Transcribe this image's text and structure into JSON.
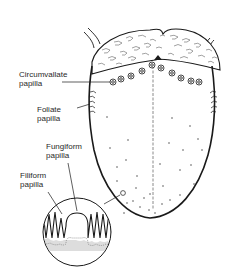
{
  "diagram": {
    "labels": [
      {
        "id": "circumvallate",
        "line1": "Circumvallate",
        "line2": "papilla"
      },
      {
        "id": "foliate",
        "line1": "Foliate",
        "line2": "papilla"
      },
      {
        "id": "fungiform",
        "line1": "Fungiform",
        "line2": "papilla"
      },
      {
        "id": "filiform",
        "line1": "Filiform",
        "line2": "papilla"
      }
    ],
    "colors": {
      "line": "#1a1a1a",
      "text": "#2a2a2a",
      "stipple": "#9a9a9a",
      "background": "#ffffff"
    }
  }
}
